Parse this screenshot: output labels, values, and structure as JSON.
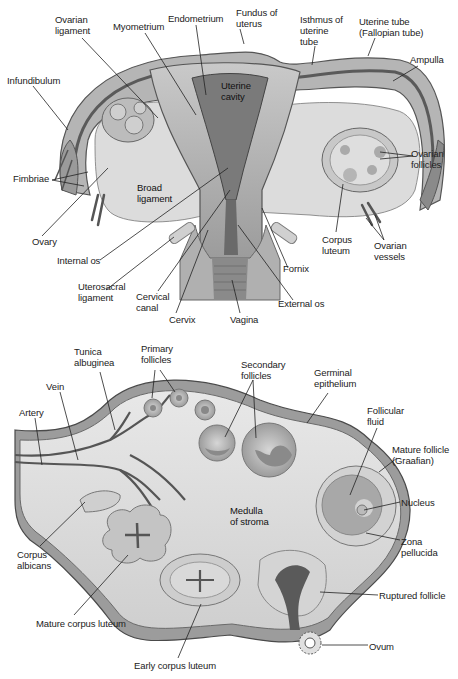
{
  "figure": {
    "panels": [
      {
        "id": "uterus",
        "description": "Frontal section of uterus, uterine tubes, ovaries and vagina",
        "labels": [
          {
            "id": "ovarian-ligament",
            "text": "Ovarian\nligament",
            "x": 55,
            "y": 14
          },
          {
            "id": "myometrium",
            "text": "Myometrium",
            "x": 113,
            "y": 21
          },
          {
            "id": "endometrium",
            "text": "Endometrium",
            "x": 168,
            "y": 13
          },
          {
            "id": "fundus",
            "text": "Fundus of\nuterus",
            "x": 236,
            "y": 7
          },
          {
            "id": "isthmus",
            "text": "Isthmus of\nuterine\ntube",
            "x": 300,
            "y": 14
          },
          {
            "id": "uterine-tube",
            "text": "Uterine tube\n(Fallopian tube)",
            "x": 359,
            "y": 16
          },
          {
            "id": "ampulla",
            "text": "Ampulla",
            "x": 410,
            "y": 54
          },
          {
            "id": "infundibulum",
            "text": "Infundibulum",
            "x": 7,
            "y": 75
          },
          {
            "id": "uterine-cavity",
            "text": "Uterine\ncavity",
            "x": 221,
            "y": 80
          },
          {
            "id": "fimbriae",
            "text": "Fimbriae",
            "x": 13,
            "y": 173
          },
          {
            "id": "broad-ligament",
            "text": "Broad\nligament",
            "x": 137,
            "y": 182
          },
          {
            "id": "ovarian-follicles",
            "text": "Ovarian\nfollicles",
            "x": 411,
            "y": 148
          },
          {
            "id": "ovary",
            "text": "Ovary",
            "x": 32,
            "y": 236
          },
          {
            "id": "internal-os",
            "text": "Internal os",
            "x": 57,
            "y": 255
          },
          {
            "id": "corpus-luteum",
            "text": "Corpus\nluteum",
            "x": 322,
            "y": 234
          },
          {
            "id": "ovarian-vessels",
            "text": "Ovarian\nvessels",
            "x": 374,
            "y": 240
          },
          {
            "id": "fornix",
            "text": "Fornix",
            "x": 283,
            "y": 263
          },
          {
            "id": "uterosacral",
            "text": "Uterosacral\nligament",
            "x": 78,
            "y": 281
          },
          {
            "id": "cervical-canal",
            "text": "Cervical\ncanal",
            "x": 136,
            "y": 291
          },
          {
            "id": "external-os",
            "text": "External os",
            "x": 278,
            "y": 298
          },
          {
            "id": "cervix",
            "text": "Cervix",
            "x": 169,
            "y": 314
          },
          {
            "id": "vagina",
            "text": "Vagina",
            "x": 230,
            "y": 314
          }
        ]
      },
      {
        "id": "ovary",
        "description": "Section of ovary showing follicle development stages",
        "labels": [
          {
            "id": "tunica",
            "text": "Tunica\nalbuginea",
            "x": 74,
            "y": 346
          },
          {
            "id": "primary-follicles",
            "text": "Primary\nfollicles",
            "x": 141,
            "y": 343
          },
          {
            "id": "secondary-follicles",
            "text": "Secondary\nfollicles",
            "x": 241,
            "y": 359
          },
          {
            "id": "germinal-epithelium",
            "text": "Germinal\nepithelium",
            "x": 314,
            "y": 367
          },
          {
            "id": "vein",
            "text": "Vein",
            "x": 46,
            "y": 381
          },
          {
            "id": "artery",
            "text": "Artery",
            "x": 19,
            "y": 407
          },
          {
            "id": "follicular-fluid",
            "text": "Follicular\nfluid",
            "x": 367,
            "y": 405
          },
          {
            "id": "mature-follicle",
            "text": "Mature follicle\n(Graafian)",
            "x": 392,
            "y": 444
          },
          {
            "id": "nucleus",
            "text": "Nucleus",
            "x": 401,
            "y": 497
          },
          {
            "id": "medulla",
            "text": "Medulla\nof stroma",
            "x": 230,
            "y": 505
          },
          {
            "id": "zona-pellucida",
            "text": "Zona\npellucida",
            "x": 401,
            "y": 536
          },
          {
            "id": "corpus-albicans",
            "text": "Corpus\nalbicans",
            "x": 17,
            "y": 549
          },
          {
            "id": "ruptured-follicle",
            "text": "Ruptured follicle",
            "x": 379,
            "y": 590
          },
          {
            "id": "mature-corpus-luteum",
            "text": "Mature corpus luteum",
            "x": 36,
            "y": 618
          },
          {
            "id": "ovum",
            "text": "Ovum",
            "x": 369,
            "y": 641
          },
          {
            "id": "early-corpus-luteum",
            "text": "Early corpus luteum",
            "x": 134,
            "y": 660
          }
        ]
      }
    ]
  },
  "colors": {
    "tissue_light": "#d9d9d9",
    "tissue_mid": "#a8a8a8",
    "tissue_dark": "#6e6e6e",
    "outline": "#4a4a4a",
    "leader": "#222222",
    "text": "#222222"
  }
}
